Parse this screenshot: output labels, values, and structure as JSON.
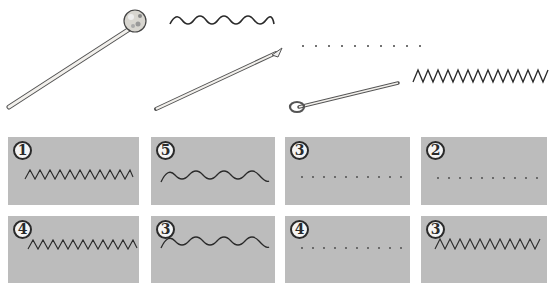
{
  "tools": [
    {
      "name": "mallet",
      "label": "felt-tipped mallet"
    },
    {
      "name": "thin-stick",
      "label": "thin stick / knitting needle"
    },
    {
      "name": "loop-wire",
      "label": "looped wire"
    }
  ],
  "reference_patterns": [
    {
      "type": "wave",
      "label": "wavy line"
    },
    {
      "type": "dots",
      "label": "dotted line"
    },
    {
      "type": "zigzag",
      "label": "zigzag line"
    }
  ],
  "cards": [
    {
      "number": "1",
      "pattern": "zigzag"
    },
    {
      "number": "5",
      "pattern": "wave"
    },
    {
      "number": "3",
      "pattern": "dots"
    },
    {
      "number": "2",
      "pattern": "dots"
    },
    {
      "number": "4",
      "pattern": "zigzag"
    },
    {
      "number": "3",
      "pattern": "wave"
    },
    {
      "number": "4",
      "pattern": "dots"
    },
    {
      "number": "3",
      "pattern": "zigzag"
    }
  ],
  "colors": {
    "card_bg": "#bcbcbc",
    "line": "#2a2a2a",
    "badge_bg": "#f4f4f4"
  }
}
